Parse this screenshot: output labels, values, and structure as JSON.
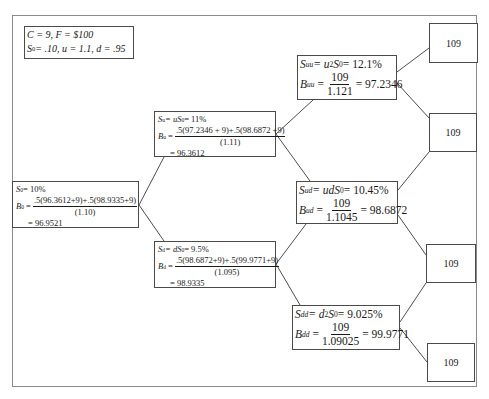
{
  "params": {
    "line1": "C = 9, F = $100",
    "line2_prefix": "S",
    "line2_sub": "0",
    "line2_rest": " = .10, u = 1.1, d = .95"
  },
  "nodes": {
    "s0": {
      "rate_label": "S",
      "rate_sub": "0",
      "rate_value": " = 10%",
      "price_label": "B",
      "price_sub": "0",
      "numerator": ".5(96.3612+9)+.5(98.9335+9)",
      "denominator": "(1.10)",
      "result": "= 96.9521"
    },
    "su": {
      "rate_label": "S",
      "rate_sub": "u",
      "rate_value": " = uS",
      "rate_value_sub": "0",
      "rate_value_end": " = 11%",
      "price_label": "B",
      "price_sub": "u",
      "numerator": ".5(97.2346 + 9)+.5(98.6872 +9)",
      "denominator": "(1.11)",
      "result": "= 96.3612"
    },
    "sd": {
      "rate_label": "S",
      "rate_sub": "d",
      "rate_value": " = dS",
      "rate_value_sub": "0",
      "rate_value_end": " = 9.5%",
      "price_label": "B",
      "price_sub": "d",
      "numerator": ".5(98.6872+9)+.5(99.9771+9)",
      "denominator": "(1.095)",
      "result": "= 98.9335"
    },
    "suu": {
      "rate_label": "S",
      "rate_sub": "uu",
      "rate_expr": " = u",
      "rate_sup": "2",
      "rate_s": "S",
      "rate_s_sub": "0",
      "rate_value": " = 12.1%",
      "price_label": "B",
      "price_sub": "uu",
      "numerator": "109",
      "denominator": "1.121",
      "result": "= 97.2346"
    },
    "sud": {
      "rate_label": "S",
      "rate_sub": "ud",
      "rate_expr": " = udS",
      "rate_s_sub": "0",
      "rate_value": " = 10.45%",
      "price_label": "B",
      "price_sub": "ud",
      "numerator": "109",
      "denominator": "1.1045",
      "result": "= 98.6872"
    },
    "sdd": {
      "rate_label": "S",
      "rate_sub": "dd",
      "rate_expr": " = d",
      "rate_sup": "2",
      "rate_s": "S",
      "rate_s_sub": "0",
      "rate_value": " = 9.025%",
      "price_label": "B",
      "price_sub": "dd",
      "numerator": "109",
      "denominator": "1.09025",
      "result": "= 99.9771"
    }
  },
  "leaves": [
    "109",
    "109",
    "109",
    "109"
  ]
}
